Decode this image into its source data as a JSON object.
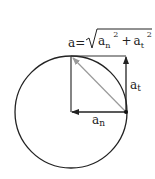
{
  "diagram": {
    "formula": {
      "lhs": "a",
      "equals": "=",
      "radical": "√",
      "term1_base": "a",
      "term1_sub": "n",
      "term1_sup": "2",
      "plus": "+",
      "term2_base": "a",
      "term2_sub": "t",
      "term2_sup": "2"
    },
    "labels": {
      "tangential": {
        "base": "a",
        "sub": "t"
      },
      "normal": {
        "base": "a",
        "sub": "n"
      }
    },
    "colors": {
      "stroke": "#222222",
      "resultant": "#9a9a9a",
      "background": "#ffffff"
    },
    "geometry": {
      "circle": {
        "cx": 71,
        "cy": 112,
        "r": 56
      },
      "point": {
        "x": 126,
        "y": 112
      },
      "corner": {
        "x": 71,
        "y": 56
      },
      "tangent_tip": {
        "x": 126,
        "y": 56
      }
    }
  }
}
